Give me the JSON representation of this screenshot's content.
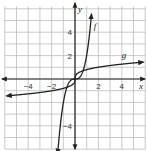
{
  "chart_data": {
    "type": "line",
    "title": "",
    "xlabel": "x",
    "ylabel": "y",
    "xlim": [
      -6,
      6
    ],
    "ylim": [
      -6,
      6.2
    ],
    "grid": true,
    "x_ticks": [
      -4,
      -2,
      2,
      4
    ],
    "y_ticks": [
      4,
      2,
      -4
    ],
    "x_tick_labels": [
      "−4",
      "−2",
      "2",
      "4"
    ],
    "y_tick_labels": [
      "4",
      "2",
      "−4"
    ],
    "series": [
      {
        "name": "f",
        "description": "steep odd function through origin (cubic-like)",
        "points": [
          [
            -1.45,
            -5.9
          ],
          [
            -1.2,
            -4
          ],
          [
            -0.9,
            -1.5
          ],
          [
            -0.6,
            -0.45
          ],
          [
            0,
            0
          ],
          [
            0.6,
            0.45
          ],
          [
            0.9,
            1.5
          ],
          [
            1.05,
            4
          ],
          [
            1.4,
            6
          ]
        ]
      },
      {
        "name": "g",
        "description": "flattening odd function through origin (cube-root-like)",
        "points": [
          [
            -5.55,
            -1.45
          ],
          [
            -4,
            -1.3
          ],
          [
            -2,
            -1.05
          ],
          [
            -1.3,
            -1.0
          ],
          [
            -0.7,
            -0.75
          ],
          [
            0,
            0
          ],
          [
            0.7,
            0.75
          ],
          [
            2,
            1.05
          ],
          [
            4,
            1.3
          ],
          [
            5.8,
            1.45
          ]
        ]
      }
    ],
    "curve_labels": [
      {
        "text": "f",
        "x": 1.6,
        "y": 4.3
      },
      {
        "text": "g",
        "x": 4.0,
        "y": 1.8
      }
    ],
    "axis_labels": {
      "x": "x",
      "y": "y"
    }
  }
}
